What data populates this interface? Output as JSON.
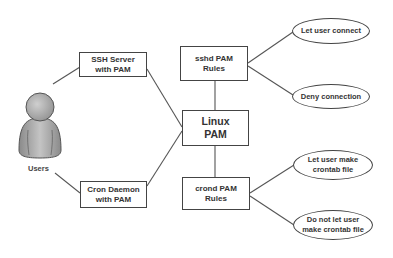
{
  "diagram": {
    "actor": {
      "label": "Users",
      "icon": "user-icon"
    },
    "nodes": {
      "ssh_server": {
        "line1": "SSH Server",
        "line2": "with PAM"
      },
      "cron_daemon": {
        "line1": "Cron Daemon",
        "line2": "with PAM"
      },
      "linux_pam": {
        "line1": "Linux",
        "line2": "PAM"
      },
      "sshd_rules": {
        "line1": "sshd PAM",
        "line2": "Rules"
      },
      "crond_rules": {
        "line1": "crond PAM",
        "line2": "Rules"
      }
    },
    "outcomes": {
      "let_connect": {
        "line1": "Let user connect"
      },
      "deny_connection": {
        "line1": "Deny connection"
      },
      "let_crontab": {
        "line1": "Let user make",
        "line2": "crontab file"
      },
      "deny_crontab": {
        "line1": "Do not let user",
        "line2": "make crontab file"
      }
    },
    "edges": [
      [
        "users",
        "ssh_server"
      ],
      [
        "users",
        "cron_daemon"
      ],
      [
        "ssh_server",
        "linux_pam"
      ],
      [
        "cron_daemon",
        "linux_pam"
      ],
      [
        "linux_pam",
        "sshd_rules"
      ],
      [
        "linux_pam",
        "crond_rules"
      ],
      [
        "sshd_rules",
        "let_connect"
      ],
      [
        "sshd_rules",
        "deny_connection"
      ],
      [
        "crond_rules",
        "let_crontab"
      ],
      [
        "crond_rules",
        "deny_crontab"
      ]
    ]
  }
}
